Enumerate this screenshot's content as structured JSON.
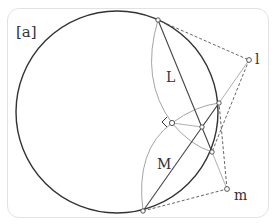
{
  "panel": {
    "tag": "[a]"
  },
  "labels": {
    "chord_L": "L",
    "chord_M": "M",
    "point_l": "l",
    "point_m": "m"
  },
  "colors": {
    "circle": "#333333",
    "chord": "#444444",
    "arc": "#9a9a9a",
    "dashed": "#555555",
    "frame": "#e2e2e2",
    "text": "#333333"
  },
  "geometry": {
    "circle": {
      "cx": 117,
      "cy": 112,
      "r": 101
    },
    "points": {
      "A": [
        158,
        20
      ],
      "B": [
        219,
        103
      ],
      "C": [
        172,
        123
      ],
      "D": [
        202,
        127
      ],
      "E": [
        212,
        152
      ],
      "F": [
        143,
        211
      ],
      "l": [
        249,
        60
      ],
      "m": [
        227,
        189
      ]
    }
  }
}
